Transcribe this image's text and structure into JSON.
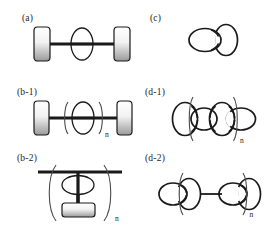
{
  "figure": {
    "background_color": "#ffffff",
    "line_color": "#1a1a1a",
    "stopper_fill_top": "#ffffff",
    "stopper_fill_bottom": "#9a9a9a",
    "repeat_subscript": "n",
    "columns": 2,
    "rows": 3
  },
  "panels": [
    {
      "id": "a",
      "label": "(a)",
      "type": "rotaxane",
      "description": "Single [2]rotaxane: dumbbell axle with two stoppers threaded through one macrocycle",
      "rings": 1,
      "stoppers": 2,
      "repeating": false,
      "orientation": "horizontal"
    },
    {
      "id": "c",
      "label": "(c)",
      "type": "catenane",
      "description": "[2]catenane: two mechanically interlocked macrocycles",
      "rings": 2,
      "stoppers": 0,
      "repeating": false,
      "orientation": "horizontal"
    },
    {
      "id": "b-1",
      "label": "(b-1)",
      "type": "poly-rotaxane-main-chain",
      "description": "Main-chain polyrotaxane: repeating macrocycle unit on the axle between two stoppers",
      "rings": 1,
      "stoppers": 2,
      "repeating": true,
      "subscript": "n",
      "orientation": "horizontal"
    },
    {
      "id": "d-1",
      "label": "(d-1)",
      "type": "poly-catenane-main-chain",
      "description": "Main-chain polycatenane: linear chain of interlocked rings with repeating unit",
      "rings": 4,
      "stoppers": 0,
      "repeating": true,
      "subscript": "n",
      "orientation": "horizontal"
    },
    {
      "id": "b-2",
      "label": "(b-2)",
      "type": "poly-rotaxane-side-chain",
      "description": "Side-chain polyrotaxane: backbone bar with pendant axle threaded through a macrocycle and capped by a stopper",
      "rings": 1,
      "stoppers": 1,
      "repeating": true,
      "subscript": "n",
      "orientation": "vertical"
    },
    {
      "id": "d-2",
      "label": "(d-2)",
      "type": "poly-catenane-side-chain",
      "description": "Side-chain polycatenane: interlocked ring pairs joined by a linear spacer, repeating unit",
      "rings": 4,
      "stoppers": 0,
      "repeating": true,
      "subscript": "n",
      "orientation": "horizontal"
    }
  ]
}
